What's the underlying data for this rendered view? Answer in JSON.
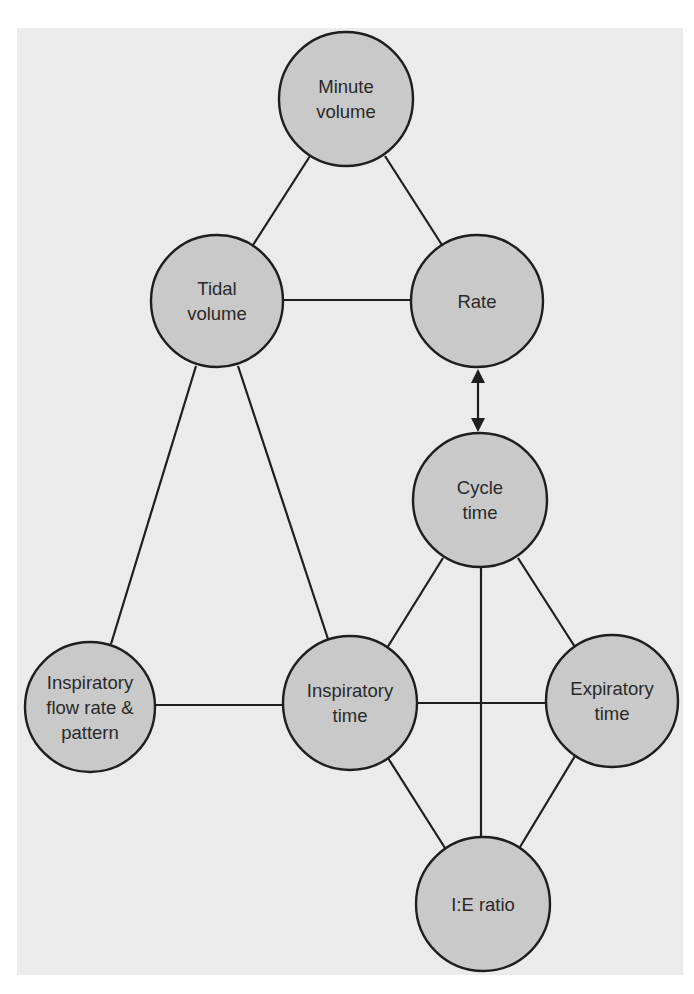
{
  "diagram": {
    "type": "concept-network",
    "colors": {
      "page_background": "#ffffff",
      "panel_background": "#ebebeb",
      "node_fill": "#c9c9c9",
      "node_stroke": "#1e1e1e",
      "edge_color": "#1e1e1e",
      "text_color": "#2a2a2a"
    },
    "nodes": {
      "minute_volume": {
        "label": "Minute\nvolume",
        "cx": 346,
        "cy": 99,
        "r": 67
      },
      "tidal_volume": {
        "label": "Tidal\nvolume",
        "cx": 217,
        "cy": 302,
        "r": 66
      },
      "rate": {
        "label": "Rate",
        "cx": 477,
        "cy": 302,
        "r": 66
      },
      "cycle_time": {
        "label": "Cycle\ntime",
        "cx": 480,
        "cy": 500,
        "r": 67
      },
      "inspiratory_flow": {
        "label": "Inspiratory\nflow rate &\npattern",
        "cx": 90,
        "cy": 707,
        "r": 65
      },
      "inspiratory_time": {
        "label": "Inspiratory\ntime",
        "cx": 350,
        "cy": 703,
        "r": 67
      },
      "expiratory_time": {
        "label": "Expiratory\ntime",
        "cx": 612,
        "cy": 701,
        "r": 66
      },
      "ie_ratio": {
        "label": "I:E ratio",
        "cx": 483,
        "cy": 904,
        "r": 67
      }
    },
    "edges": [
      {
        "from": "minute_volume",
        "to": "tidal_volume",
        "type": "line"
      },
      {
        "from": "minute_volume",
        "to": "rate",
        "type": "line"
      },
      {
        "from": "tidal_volume",
        "to": "rate",
        "type": "line"
      },
      {
        "from": "rate",
        "to": "cycle_time",
        "type": "double-arrow"
      },
      {
        "from": "tidal_volume",
        "to": "inspiratory_flow",
        "type": "line"
      },
      {
        "from": "tidal_volume",
        "to": "inspiratory_time",
        "type": "line"
      },
      {
        "from": "inspiratory_flow",
        "to": "inspiratory_time",
        "type": "line"
      },
      {
        "from": "inspiratory_time",
        "to": "expiratory_time",
        "type": "line"
      },
      {
        "from": "cycle_time",
        "to": "inspiratory_time",
        "type": "line"
      },
      {
        "from": "cycle_time",
        "to": "expiratory_time",
        "type": "line"
      },
      {
        "from": "cycle_time",
        "to": "ie_ratio",
        "type": "line"
      },
      {
        "from": "inspiratory_time",
        "to": "ie_ratio",
        "type": "line"
      },
      {
        "from": "expiratory_time",
        "to": "ie_ratio",
        "type": "line"
      }
    ]
  }
}
